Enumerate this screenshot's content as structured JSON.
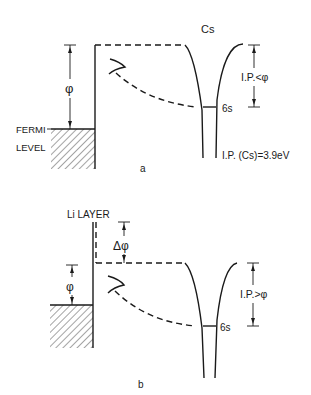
{
  "figure": {
    "panels": [
      {
        "id": "a",
        "caption": "a",
        "atom_label": "Cs",
        "work_function_label": "φ",
        "fermi_label_line1": "FERMI",
        "fermi_label_line2": "LEVEL",
        "level_label": "6s",
        "ip_comparison_label": "I.P.<φ",
        "ip_value_label": "I.P. (Cs)=3.9eV"
      },
      {
        "id": "b",
        "caption": "b",
        "layer_label": "Li LAYER",
        "delta_phi_label": "Δφ",
        "work_function_label": "φ",
        "level_label": "6s",
        "ip_comparison_label": "I.P.>φ"
      }
    ],
    "colors": {
      "ink": "#1a1a1a",
      "background": "#ffffff"
    }
  }
}
